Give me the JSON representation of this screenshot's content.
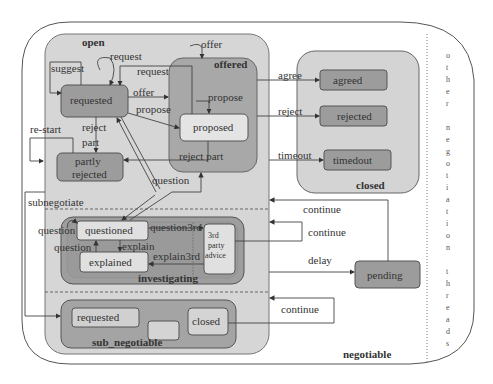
{
  "colors": {
    "outer_bg": "#ffffff",
    "open_bg": "#d6d6d6",
    "offered_bg": "#a8a8a8",
    "state_dark": "#9c9c9c",
    "state_light": "#e4e4e4",
    "closed_bg": "#d4d4d4",
    "investigating_bg": "#9e9e9e",
    "line": "#444444"
  },
  "regions": {
    "negotiable": "negotiable",
    "open": "open",
    "offered": "offered",
    "closed": "closed",
    "investigating": "investigating",
    "sub_negotiable": "sub_negotiable",
    "other_threads": [
      "o",
      "t",
      "h",
      "e",
      "r",
      "",
      "n",
      "e",
      "g",
      "o",
      "t",
      "i",
      "a",
      "t",
      "i",
      "o",
      "n",
      "",
      "t",
      "h",
      "r",
      "e",
      "a",
      "d",
      "s"
    ]
  },
  "states": {
    "requested": "requested",
    "partly_rejected_1": "partly",
    "partly_rejected_2": "rejected",
    "proposed": "proposed",
    "agreed": "agreed",
    "rejected": "rejected",
    "timedout": "timedout",
    "questioned": "questioned",
    "explained": "explained",
    "third_party_1": "3rd",
    "third_party_2": "party",
    "third_party_3": "advice",
    "pending": "pending",
    "sub_requested": "requested",
    "sub_closed": "closed"
  },
  "transitions": {
    "suggest": "suggest",
    "request_self": "request",
    "request_back": "request",
    "offer_entry": "offer",
    "offer": "offer",
    "propose": "propose",
    "propose_entry": "propose",
    "reject_part_1": "reject",
    "reject_part_2": "part",
    "reject_part_from_offered": "reject part",
    "re_start": "re-start",
    "question_to_offered": "question",
    "agree": "agree",
    "reject": "reject",
    "timeout": "timeout",
    "subnegotiate": "subnegotiate",
    "question_self": "question",
    "question_up": "question",
    "explain": "explain",
    "question3rd": "question3rd",
    "explain3rd": "explain3rd",
    "continue_1": "continue",
    "continue_2": "continue",
    "delay": "delay",
    "continue_3": "continue"
  }
}
